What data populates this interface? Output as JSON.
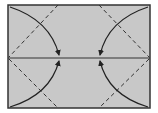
{
  "diagram": {
    "type": "origami-fold-diagram",
    "paper_color": "#c8c8c8",
    "line_color": "#222222",
    "border_color": "#333333",
    "background": "#ffffff",
    "elements": [
      {
        "name": "center-crease",
        "kind": "solid-line"
      },
      {
        "name": "valley-fold-top-left",
        "kind": "dashed-line"
      },
      {
        "name": "valley-fold-bottom-left",
        "kind": "dashed-line"
      },
      {
        "name": "valley-fold-top-right",
        "kind": "dashed-line"
      },
      {
        "name": "valley-fold-bottom-right",
        "kind": "dashed-line"
      },
      {
        "name": "fold-arrow-top-left",
        "kind": "curved-arrow"
      },
      {
        "name": "fold-arrow-bottom-left",
        "kind": "curved-arrow"
      },
      {
        "name": "fold-arrow-top-right",
        "kind": "curved-arrow"
      },
      {
        "name": "fold-arrow-bottom-right",
        "kind": "curved-arrow"
      }
    ]
  }
}
